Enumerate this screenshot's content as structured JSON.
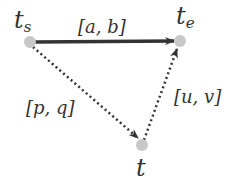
{
  "diagram": {
    "nodes": [
      {
        "id": "ts",
        "label": "t",
        "sub": "s",
        "x": 30,
        "y": 42
      },
      {
        "id": "te",
        "label": "t",
        "sub": "e",
        "x": 180,
        "y": 41
      },
      {
        "id": "t",
        "label": "t",
        "sub": "",
        "x": 142,
        "y": 145
      }
    ],
    "edges": [
      {
        "from": "ts",
        "to": "te",
        "label": "[a, b]",
        "style": "solid"
      },
      {
        "from": "ts",
        "to": "t",
        "label": "[p, q]",
        "style": "dotted"
      },
      {
        "from": "t",
        "to": "te",
        "label": "[u, v]",
        "style": "dotted"
      }
    ]
  },
  "colors": {
    "node": "#c8c8c8",
    "edge": "#333333",
    "text": "#333333"
  }
}
